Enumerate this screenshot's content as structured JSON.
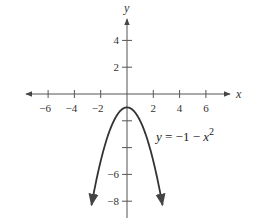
{
  "chart_data": {
    "type": "line",
    "title": "",
    "xlabel": "x",
    "ylabel": "y",
    "xlim": [
      -7.5,
      8.0
    ],
    "ylim": [
      -8.8,
      6.0
    ],
    "grid": false,
    "x_ticks": [
      -6,
      -4,
      -2,
      2,
      4,
      6
    ],
    "x_tick_labels": [
      "−6",
      "−4",
      "−2",
      "2",
      "4",
      "6"
    ],
    "y_ticks": [
      4,
      2,
      -2,
      -4,
      -6,
      -8
    ],
    "y_tick_labels": [
      "4",
      "2",
      "",
      "",
      "−6",
      "−8"
    ],
    "series": [
      {
        "name": "y = −1 − x²",
        "equation": "y = -1 - x^2",
        "domain": [
          -2.7,
          2.7
        ],
        "vertex": [
          0,
          -1
        ],
        "x": [
          -2.7,
          -2,
          -1,
          0,
          1,
          2,
          2.7
        ],
        "y": [
          -8.29,
          -5,
          -2,
          -1,
          -2,
          -5,
          -8.29
        ],
        "color": "#333333",
        "arrows_at_ends": true
      }
    ],
    "annotations": [
      {
        "text_prefix": "y = −1 − x",
        "superscript": "2",
        "position": [
          2.1,
          -3.5
        ]
      }
    ],
    "legend": null
  },
  "colors": {
    "axis": "#555555",
    "curve": "#333333",
    "text": "#333333",
    "background": "#ffffff"
  }
}
